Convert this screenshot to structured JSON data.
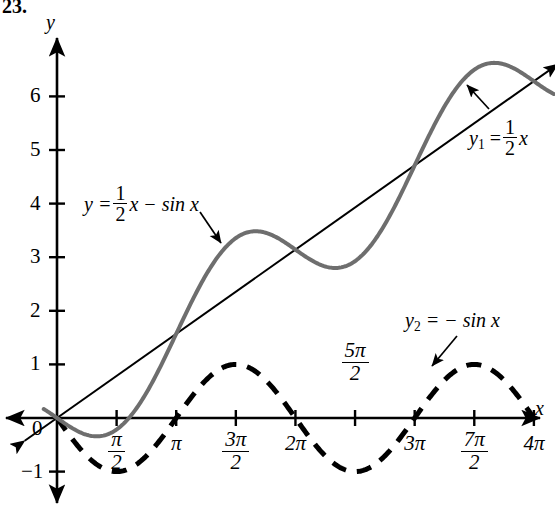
{
  "figure": {
    "problem_number": "23.",
    "axis_labels": {
      "x": "x",
      "y": "y"
    },
    "origin_label": "0"
  },
  "annotations": {
    "curve_sum": {
      "lhs": "y =",
      "coef_num": "1",
      "coef_den": "2",
      "rhs": "x − sin x"
    },
    "line": {
      "lhs": "y",
      "sub": "1",
      "eq": "=",
      "coef_num": "1",
      "coef_den": "2",
      "rhs": "x"
    },
    "sine": {
      "text": "y",
      "sub": "2",
      "rest": "= − sin x"
    }
  },
  "y_axis": {
    "ticks": [
      {
        "label": "6",
        "value": 6
      },
      {
        "label": "5",
        "value": 5
      },
      {
        "label": "4",
        "value": 4
      },
      {
        "label": "3",
        "value": 3
      },
      {
        "label": "2",
        "value": 2
      },
      {
        "label": "1",
        "value": 1
      },
      {
        "label": "−1",
        "value": -1
      }
    ]
  },
  "x_axis": {
    "ticks": [
      {
        "num": "π",
        "den": "2",
        "value": 1.5707963,
        "stacked": true,
        "above": false
      },
      {
        "num": "π",
        "den": "",
        "value": 3.1415927,
        "stacked": false,
        "above": false
      },
      {
        "num": "3π",
        "den": "2",
        "value": 4.712389,
        "stacked": true,
        "above": false
      },
      {
        "num": "2π",
        "den": "",
        "value": 6.2831853,
        "stacked": false,
        "above": false
      },
      {
        "num": "5π",
        "den": "2",
        "value": 7.8539816,
        "stacked": true,
        "above": true
      },
      {
        "num": "3π",
        "den": "",
        "value": 9.424778,
        "stacked": false,
        "above": false
      },
      {
        "num": "7π",
        "den": "2",
        "value": 10.9955743,
        "stacked": true,
        "above": false
      },
      {
        "num": "4π",
        "den": "",
        "value": 12.5663706,
        "stacked": false,
        "above": false
      }
    ]
  },
  "colors": {
    "axis": "#000000",
    "line_y1": "#000000",
    "curve_sum": "#6e6e6e",
    "curve_sine": "#000000",
    "background": "#ffffff"
  },
  "chart_data": {
    "type": "line",
    "title": "",
    "xlabel": "x",
    "ylabel": "y",
    "xlim": [
      -0.9,
      13.4
    ],
    "ylim": [
      -1.9,
      7.0
    ],
    "grid": false,
    "legend": "inline-annotations",
    "x_tick_values": [
      1.5707963,
      3.1415927,
      4.712389,
      6.2831853,
      7.8539816,
      9.424778,
      10.9955743,
      12.5663706
    ],
    "x_tick_labels": [
      "π/2",
      "π",
      "3π/2",
      "2π",
      "5π/2",
      "3π",
      "7π/2",
      "4π"
    ],
    "y_tick_values": [
      -1,
      1,
      2,
      3,
      4,
      5,
      6
    ],
    "y_tick_labels": [
      "−1",
      "1",
      "2",
      "3",
      "4",
      "5",
      "6"
    ],
    "series": [
      {
        "name": "y = 1/2 x − sin x",
        "formula": "0.5*x - sin(x)",
        "style": "solid",
        "color": "#6e6e6e",
        "width": 4,
        "domain": [
          -0.35,
          13.1
        ],
        "key_points": [
          {
            "x": 0,
            "y": 0
          },
          {
            "x": 1.0472,
            "y": -0.3424,
            "note": "local minimum"
          },
          {
            "x": 3.1416,
            "y": 1.5708
          },
          {
            "x": 5.236,
            "y": 3.484,
            "note": "local maximum"
          },
          {
            "x": 6.2832,
            "y": 3.1416,
            "note": "inflection"
          },
          {
            "x": 7.3304,
            "y": 2.7992,
            "note": "local minimum"
          },
          {
            "x": 9.4248,
            "y": 4.7124
          },
          {
            "x": 11.5192,
            "y": 6.6256,
            "note": "local maximum"
          },
          {
            "x": 12.5664,
            "y": 6.2832
          }
        ]
      },
      {
        "name": "y1 = 1/2 x",
        "formula": "0.5*x",
        "style": "solid",
        "color": "#000000",
        "width": 2,
        "domain": [
          -0.85,
          13.2
        ],
        "arrows": "both"
      },
      {
        "name": "y2 = − sin x",
        "formula": "-sin(x)",
        "style": "dashed",
        "color": "#000000",
        "width": 5,
        "domain": [
          0,
          12.5664
        ],
        "key_points": [
          {
            "x": 1.5708,
            "y": -1,
            "note": "minimum"
          },
          {
            "x": 3.1416,
            "y": 0
          },
          {
            "x": 4.712389,
            "y": 1,
            "note": "maximum"
          },
          {
            "x": 6.2832,
            "y": 0
          },
          {
            "x": 7.854,
            "y": -1,
            "note": "minimum"
          },
          {
            "x": 9.4248,
            "y": 0
          },
          {
            "x": 10.9956,
            "y": 1,
            "note": "maximum"
          },
          {
            "x": 12.5664,
            "y": 0
          }
        ]
      }
    ]
  }
}
